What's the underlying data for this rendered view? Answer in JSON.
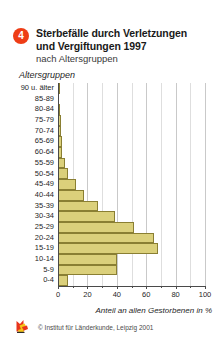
{
  "header": {
    "badge": "4",
    "title_line1": "Sterbefälle durch Verletzungen",
    "title_line2": "und Vergiftungen 1997",
    "subtitle": "nach Altersgruppen"
  },
  "footer": {
    "source": "© Institut für Länderkunde, Leipzig 2001",
    "logo_icon": "ifl-fox-logo-icon"
  },
  "colors": {
    "badge": "#ee3d16",
    "bar_fill": "#dbd07b",
    "bar_stroke": "#8a7f33",
    "axis": "#4a4a4a",
    "grid": "#c9c9c9",
    "text": "#1f1f1f",
    "background": "#ffffff"
  },
  "chart_data": {
    "type": "bar",
    "orientation": "horizontal",
    "title": "Sterbefälle durch Verletzungen und Vergiftungen 1997",
    "subtitle": "nach Altersgruppen",
    "ylabel": "Altersgruppen",
    "xlabel": "Anteil an allen Gestorbenen in %",
    "xlim": [
      0,
      100
    ],
    "xticks": [
      0,
      20,
      40,
      60,
      80,
      100
    ],
    "xticklabels": [
      "0",
      "20",
      "40",
      "60",
      "80",
      "100"
    ],
    "minor_gridlines": [
      10,
      30,
      50,
      70,
      90
    ],
    "grid": true,
    "legend": null,
    "categories": [
      "90 u. älter",
      "85-89",
      "80-84",
      "75-79",
      "70-74",
      "65-69",
      "60-64",
      "55-59",
      "50-54",
      "45-49",
      "40-44",
      "35-39",
      "30-34",
      "25-29",
      "20-24",
      "15-19",
      "10-14",
      "5-9",
      "0-4"
    ],
    "values": [
      1.5,
      1.0,
      1.5,
      1.8,
      2.0,
      2.4,
      3.0,
      5.0,
      7.0,
      12.0,
      18.0,
      27.0,
      39.0,
      52.0,
      65.0,
      68.0,
      40.0,
      40.0,
      7.0
    ]
  }
}
